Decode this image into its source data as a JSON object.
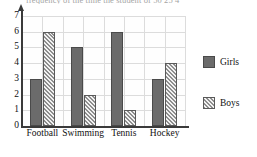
{
  "clipped_text_above": "frequency of the time the student of 50   25   4",
  "chart_data": {
    "type": "bar",
    "title": "",
    "xlabel": "",
    "ylabel": "",
    "categories": [
      "Football",
      "Swimming",
      "Tennis",
      "Hockey"
    ],
    "series": [
      {
        "name": "Girls",
        "values": [
          3,
          5,
          6,
          3
        ],
        "color": "#6b6b6b",
        "fill": "solid"
      },
      {
        "name": "Boys",
        "values": [
          6,
          2,
          1,
          4
        ],
        "color": "#8e8e8e",
        "fill": "hatched"
      }
    ],
    "ylim": [
      0,
      7
    ],
    "yticks": [
      0,
      1,
      2,
      3,
      4,
      5,
      6,
      7
    ],
    "ytick_labels": [
      "0",
      "1",
      "2",
      "3",
      "4",
      "5",
      "6",
      "7"
    ],
    "grid": true,
    "legend_position": "right",
    "legend": [
      "Girls",
      "Boys"
    ]
  }
}
